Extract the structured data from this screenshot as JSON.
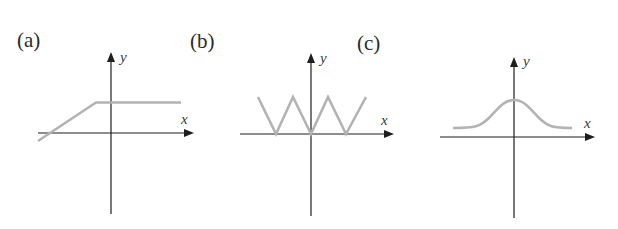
{
  "figure": {
    "panels": [
      {
        "id": "a",
        "label": "(a)",
        "x_axis_label": "x",
        "y_axis_label": "y",
        "description": "Ramp function: linear increase crossing the x-axis left of origin, then constant positive value",
        "curve_color": "#b3b3b3"
      },
      {
        "id": "b",
        "label": "(b)",
        "x_axis_label": "x",
        "y_axis_label": "y",
        "description": "Triangle wave (zigzag) with minima touching the x-axis, including at the origin",
        "curve_color": "#b3b3b3"
      },
      {
        "id": "c",
        "label": "(c)",
        "x_axis_label": "x",
        "y_axis_label": "y",
        "description": "Bell-shaped (Gaussian-like) curve centered on the y-axis, above a positive baseline",
        "curve_color": "#b3b3b3"
      }
    ],
    "axis_color": "#1e1e1e"
  }
}
